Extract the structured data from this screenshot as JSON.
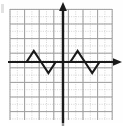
{
  "figure": {
    "title": "",
    "background_color": "#fefefe",
    "width": 123,
    "height": 129
  },
  "axes": {
    "x_axis_label": "",
    "y_axis_label": "",
    "axis_color": "#1a1a1a",
    "x_axis_pixel_y": 62,
    "y_axis_pixel_x": 63,
    "x_arrow": "right-arrowhead",
    "y_arrow": "up-arrowhead",
    "tick_labels_visible": false
  },
  "grid": {
    "visible": true,
    "style": "dotted",
    "minor_color": "#c9c9c9",
    "major_color": "#a8a8a8",
    "minor_step_px": 7.3,
    "major_every": 2,
    "left_px": 10,
    "right_px": 112,
    "top_px": 9,
    "bottom_px": 120
  },
  "chart_data": {
    "type": "line",
    "title": "",
    "xlabel": "",
    "ylabel": "",
    "grid": true,
    "legend_position": "none",
    "xlim": [
      -7.25,
      6.75
    ],
    "ylim": [
      -7.25,
      7.25
    ],
    "series": [
      {
        "name": "triangle-wave",
        "color": "#1a1a1a",
        "line_width_px": 2.1,
        "x": [
          -7.25,
          -6,
          -5,
          -4,
          -3,
          -2,
          -1,
          0,
          1,
          2,
          3,
          4,
          5,
          6.75
        ],
        "y": [
          0,
          0,
          0,
          1,
          0,
          -1,
          0,
          0,
          0,
          1,
          0,
          -1,
          0,
          0
        ]
      }
    ],
    "annotations": [
      {
        "label": "left-peak",
        "x": -4,
        "y": 1
      },
      {
        "label": "left-valley",
        "x": -2,
        "y": -1
      },
      {
        "label": "right-peak",
        "x": 2,
        "y": 1
      },
      {
        "label": "right-valley",
        "x": 4,
        "y": -1
      }
    ]
  }
}
